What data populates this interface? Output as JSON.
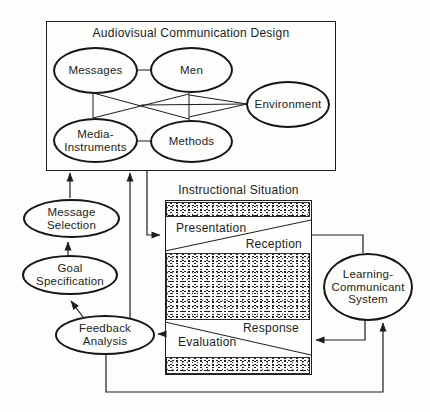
{
  "colors": {
    "ink": "#1d1d1b",
    "paper": "#fdfdfc"
  },
  "acd_box": {
    "title": "Audiovisual Communication Design",
    "nodes": {
      "messages": "Messages",
      "men": "Men",
      "environment": "Environment",
      "media_instruments": "Media-Instruments",
      "methods": "Methods"
    }
  },
  "instructional_situation": {
    "title": "Instructional Situation",
    "labels": {
      "presentation": "Presentation",
      "reception": "Reception",
      "response": "Response",
      "evaluation": "Evaluation"
    }
  },
  "process": {
    "message_selection": "Message Selection",
    "goal_specification": "Goal Specification",
    "feedback_analysis": "Feedback Analysis",
    "learning_communicant_system": "Learning-Communicant System"
  }
}
